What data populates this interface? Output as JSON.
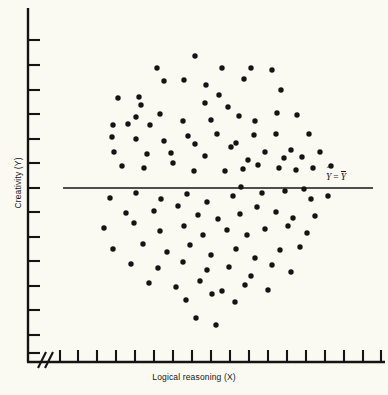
{
  "figure": {
    "background_color": "#fbfaf2",
    "ink_color": "#141414",
    "width": 388,
    "height": 395
  },
  "axes": {
    "x_title": "Logical reasoning (X)",
    "y_title": "Creativity (Y)",
    "x_axis_break_symbol": "//",
    "x_tick_count": 18,
    "y_tick_count": 14,
    "x_axis_line": {
      "x1": 28,
      "y1": 362,
      "x2": 385,
      "y2": 362
    },
    "y_axis_line": {
      "x1": 28,
      "y1": 8,
      "x2": 28,
      "y2": 362
    },
    "x_ticks_px": [
      60,
      78,
      97,
      116,
      135,
      154,
      173,
      192,
      211,
      230,
      249,
      268,
      287,
      306,
      325,
      344,
      363,
      381
    ],
    "y_ticks_px": [
      40,
      65,
      90,
      114,
      139,
      163,
      188,
      212,
      237,
      261,
      286,
      310,
      335,
      353
    ]
  },
  "annotation": {
    "regression_label_plain": "Y-hat = Y-bar",
    "y_hat_symbol": "Y",
    "equals_symbol": "=",
    "y_bar_symbol": "Y"
  },
  "chart_data": {
    "type": "scatter",
    "title": "",
    "xlabel": "Logical reasoning (X)",
    "ylabel": "Creativity (Y)",
    "grid": false,
    "legend": false,
    "xlim_px": [
      28,
      385
    ],
    "ylim_px": [
      8,
      362
    ],
    "point_radius_px": 2.7,
    "point_color": "#141414",
    "n_points": 96,
    "reference_line": {
      "label": "Y-hat = Y-bar",
      "type": "horizontal",
      "slope": 0,
      "y_px": 188,
      "x_start_px": 63,
      "x_end_px": 373,
      "meaning": "predicted Y equals mean of Y; zero correlation"
    },
    "points_px": [
      [
        195,
        56
      ],
      [
        157,
        68
      ],
      [
        222,
        68
      ],
      [
        184,
        80
      ],
      [
        251,
        68
      ],
      [
        272,
        70
      ],
      [
        139,
        97
      ],
      [
        164,
        81
      ],
      [
        206,
        85
      ],
      [
        244,
        79
      ],
      [
        219,
        95
      ],
      [
        281,
        90
      ],
      [
        118,
        98
      ],
      [
        141,
        105
      ],
      [
        205,
        103
      ],
      [
        136,
        117
      ],
      [
        228,
        107
      ],
      [
        160,
        114
      ],
      [
        113,
        125
      ],
      [
        128,
        124
      ],
      [
        150,
        125
      ],
      [
        183,
        121
      ],
      [
        211,
        120
      ],
      [
        239,
        116
      ],
      [
        255,
        121
      ],
      [
        277,
        113
      ],
      [
        297,
        115
      ],
      [
        112,
        137
      ],
      [
        136,
        139
      ],
      [
        164,
        141
      ],
      [
        195,
        144
      ],
      [
        188,
        136
      ],
      [
        217,
        134
      ],
      [
        236,
        143
      ],
      [
        254,
        135
      ],
      [
        276,
        134
      ],
      [
        291,
        150
      ],
      [
        309,
        134
      ],
      [
        114,
        152
      ],
      [
        147,
        154
      ],
      [
        171,
        153
      ],
      [
        205,
        156
      ],
      [
        231,
        147
      ],
      [
        248,
        160
      ],
      [
        265,
        152
      ],
      [
        284,
        158
      ],
      [
        302,
        157
      ],
      [
        320,
        152
      ],
      [
        122,
        166
      ],
      [
        144,
        168
      ],
      [
        173,
        163
      ],
      [
        194,
        171
      ],
      [
        225,
        171
      ],
      [
        243,
        169
      ],
      [
        258,
        165
      ],
      [
        279,
        168
      ],
      [
        296,
        170
      ],
      [
        313,
        168
      ],
      [
        331,
        166
      ],
      [
        110,
        198
      ],
      [
        136,
        193
      ],
      [
        161,
        199
      ],
      [
        187,
        194
      ],
      [
        207,
        202
      ],
      [
        233,
        196
      ],
      [
        241,
        187
      ],
      [
        262,
        193
      ],
      [
        285,
        191
      ],
      [
        304,
        189
      ],
      [
        311,
        199
      ],
      [
        328,
        196
      ],
      [
        126,
        213
      ],
      [
        154,
        211
      ],
      [
        178,
        206
      ],
      [
        198,
        215
      ],
      [
        218,
        219
      ],
      [
        240,
        214
      ],
      [
        257,
        207
      ],
      [
        276,
        212
      ],
      [
        293,
        218
      ],
      [
        315,
        216
      ],
      [
        104,
        228
      ],
      [
        134,
        223
      ],
      [
        160,
        231
      ],
      [
        184,
        226
      ],
      [
        203,
        235
      ],
      [
        227,
        230
      ],
      [
        247,
        235
      ],
      [
        265,
        229
      ],
      [
        288,
        226
      ],
      [
        307,
        233
      ],
      [
        113,
        249
      ],
      [
        143,
        244
      ],
      [
        167,
        252
      ],
      [
        190,
        245
      ],
      [
        211,
        255
      ],
      [
        236,
        249
      ],
      [
        255,
        258
      ],
      [
        280,
        250
      ],
      [
        300,
        247
      ],
      [
        131,
        264
      ],
      [
        158,
        268
      ],
      [
        183,
        262
      ],
      [
        207,
        270
      ],
      [
        229,
        267
      ],
      [
        251,
        276
      ],
      [
        272,
        265
      ],
      [
        291,
        272
      ],
      [
        149,
        283
      ],
      [
        176,
        287
      ],
      [
        200,
        281
      ],
      [
        222,
        291
      ],
      [
        245,
        285
      ],
      [
        268,
        290
      ],
      [
        186,
        300
      ],
      [
        212,
        294
      ],
      [
        235,
        302
      ],
      [
        196,
        318
      ],
      [
        216,
        325
      ]
    ]
  }
}
